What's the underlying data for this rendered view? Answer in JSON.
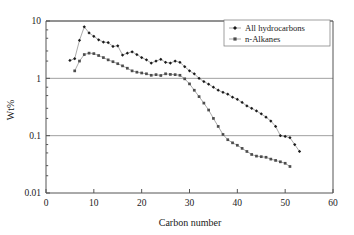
{
  "chart_data": {
    "type": "line",
    "title": "",
    "xlabel": "Carbon number",
    "ylabel": "Wt%",
    "xlim": [
      0,
      60
    ],
    "ylim": [
      0.01,
      10
    ],
    "yscale": "log",
    "xticks": [
      0,
      10,
      20,
      30,
      40,
      50,
      60
    ],
    "xtick_labels": [
      "0",
      "10",
      "20",
      "30",
      "40",
      "50",
      "60"
    ],
    "yticks": [
      0.01,
      0.1,
      1,
      10
    ],
    "ytick_labels": [
      "0.01",
      "0.1",
      "1",
      "10"
    ],
    "grid": "horizontal-major",
    "legend_position": "top-right",
    "series": [
      {
        "name": "All hydrocarbons",
        "marker": "small-filled-diamond",
        "color": "#1a1a1a",
        "x": [
          5,
          6,
          7,
          8,
          9,
          10,
          11,
          12,
          13,
          14,
          15,
          16,
          17,
          18,
          19,
          20,
          21,
          22,
          23,
          24,
          25,
          26,
          27,
          28,
          29,
          30,
          31,
          32,
          33,
          34,
          35,
          36,
          37,
          38,
          39,
          40,
          41,
          42,
          43,
          44,
          45,
          46,
          47,
          48,
          49,
          50,
          51,
          52,
          53
        ],
        "y": [
          2.05,
          2.2,
          4.6,
          7.9,
          6.2,
          5.4,
          4.7,
          4.3,
          4.2,
          3.6,
          3.7,
          2.55,
          2.75,
          2.9,
          2.6,
          2.3,
          2.1,
          1.85,
          2.0,
          2.15,
          1.9,
          1.85,
          2.0,
          1.9,
          1.6,
          1.35,
          1.2,
          1.0,
          0.88,
          0.79,
          0.7,
          0.62,
          0.57,
          0.53,
          0.47,
          0.43,
          0.38,
          0.33,
          0.3,
          0.27,
          0.24,
          0.21,
          0.18,
          0.145,
          0.1,
          0.097,
          0.092,
          0.07,
          0.053
        ]
      },
      {
        "name": "n-Alkanes",
        "marker": "small-filled-square",
        "color": "#4d4d4d",
        "x": [
          6,
          7,
          8,
          9,
          10,
          11,
          12,
          13,
          14,
          15,
          16,
          17,
          18,
          19,
          20,
          21,
          22,
          23,
          24,
          25,
          26,
          27,
          28,
          29,
          30,
          31,
          32,
          33,
          34,
          35,
          36,
          37,
          38,
          39,
          40,
          41,
          42,
          43,
          44,
          45,
          46,
          47,
          48,
          49,
          50,
          51
        ],
        "y": [
          1.35,
          2.0,
          2.6,
          2.75,
          2.7,
          2.5,
          2.3,
          2.1,
          1.95,
          1.8,
          1.65,
          1.5,
          1.35,
          1.28,
          1.24,
          1.2,
          1.13,
          1.16,
          1.12,
          1.2,
          1.17,
          1.16,
          1.13,
          0.98,
          0.8,
          0.62,
          0.48,
          0.37,
          0.28,
          0.2,
          0.145,
          0.105,
          0.085,
          0.075,
          0.068,
          0.06,
          0.053,
          0.047,
          0.044,
          0.043,
          0.042,
          0.039,
          0.037,
          0.035,
          0.033,
          0.029
        ]
      }
    ]
  }
}
